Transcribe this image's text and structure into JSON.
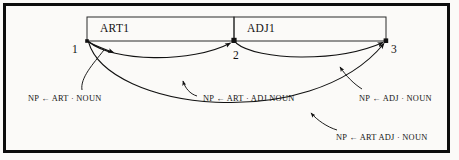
{
  "figure": {
    "kind": "chart-parser-state-diagram",
    "background_color": "#fbfaf8",
    "ink_color": "#111111",
    "frame_color": "#0d0d0d"
  },
  "chart": {
    "cells": [
      {
        "label": "ART1",
        "x": 87,
        "y": 17,
        "width": 147,
        "height": 24
      },
      {
        "label": "ADJ1",
        "x": 234,
        "y": 17,
        "width": 152,
        "height": 24
      }
    ],
    "nodes": [
      {
        "label": "1",
        "x": 87,
        "y": 41
      },
      {
        "label": "2",
        "x": 234,
        "y": 41
      },
      {
        "label": "3",
        "x": 386,
        "y": 41
      }
    ]
  },
  "arcs": [
    {
      "id": "arc-art-dot-noun",
      "label": "NP ← ART · NOUN",
      "from_node": "1",
      "to_node": "1",
      "label_x": 28,
      "label_y": 94
    },
    {
      "id": "arc-art-dot-adj-noun",
      "label": "NP ← ART · ADJ NOUN",
      "from_node": "1",
      "to_node": "2",
      "label_x": 203,
      "label_y": 94
    },
    {
      "id": "arc-adj-dot-noun",
      "label": "NP ← ADJ · NOUN",
      "from_node": "2",
      "to_node": "3",
      "label_x": 359,
      "label_y": 94
    },
    {
      "id": "arc-art-adj-dot-noun",
      "label": "NP ← ART ADJ · NOUN",
      "from_node": "1",
      "to_node": "3",
      "label_x": 336,
      "label_y": 133
    }
  ]
}
